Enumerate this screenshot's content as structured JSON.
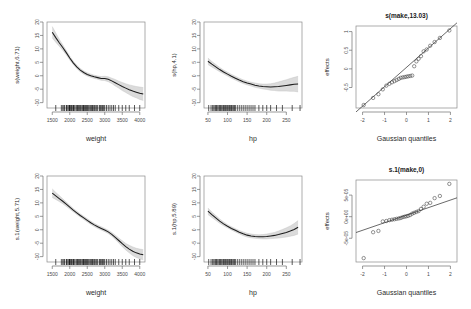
{
  "figure": {
    "layout": "2 rows x 3 columns",
    "background": "#ffffff",
    "line_color": "#1c1c1c",
    "band_color": "#d9d9d9",
    "point_color": "#3a3a3a"
  },
  "chart_data": [
    {
      "id": "panel-weight-top",
      "type": "line",
      "title": "",
      "xlabel": "weight",
      "ylabel": "s(weight,6.71)",
      "xlim": [
        1350,
        4150
      ],
      "ylim": [
        -12,
        20
      ],
      "xticks": [
        1500,
        2000,
        2500,
        3000,
        3500,
        4000
      ],
      "yticks": [
        -10,
        -5,
        0,
        5,
        10,
        15,
        20
      ],
      "grid": false,
      "legend": "none",
      "series": [
        {
          "name": "smooth fit",
          "x": [
            1500,
            1600,
            1700,
            1800,
            1900,
            2000,
            2100,
            2200,
            2300,
            2400,
            2500,
            2600,
            2700,
            2800,
            2900,
            3000,
            3100,
            3200,
            3300,
            3400,
            3500,
            3600,
            3700,
            3800,
            3900,
            4000,
            4100
          ],
          "values": [
            16.2,
            14.2,
            12.3,
            10.5,
            8.6,
            6.6,
            4.8,
            3.3,
            2.1,
            1.2,
            0.5,
            0.0,
            -0.4,
            -0.7,
            -1.0,
            -1.0,
            -1.3,
            -1.9,
            -2.6,
            -3.3,
            -4.0,
            -4.6,
            -5.2,
            -5.7,
            -6.1,
            -6.5,
            -6.8
          ],
          "upper": [
            18.3,
            15.9,
            13.6,
            11.5,
            9.4,
            7.3,
            5.4,
            3.9,
            2.7,
            1.8,
            1.1,
            0.6,
            0.2,
            -0.1,
            -0.3,
            -0.2,
            -0.4,
            -0.9,
            -1.4,
            -2.0,
            -2.5,
            -3.0,
            -3.4,
            -3.7,
            -4.0,
            -4.2,
            -4.4
          ],
          "lower": [
            14.1,
            12.5,
            11.0,
            9.5,
            7.8,
            5.9,
            4.2,
            2.7,
            1.5,
            0.6,
            -0.1,
            -0.6,
            -1.0,
            -1.3,
            -1.7,
            -1.8,
            -2.2,
            -2.9,
            -3.8,
            -4.6,
            -5.5,
            -6.2,
            -7.0,
            -7.7,
            -8.2,
            -8.8,
            -9.2
          ]
        }
      ],
      "rug_x": [
        1600,
        1760,
        1800,
        1835,
        1845,
        1900,
        1915,
        1925,
        1975,
        1985,
        1990,
        2000,
        2025,
        2050,
        2070,
        2100,
        2110,
        2125,
        2155,
        2200,
        2210,
        2230,
        2245,
        2275,
        2300,
        2320,
        2350,
        2375,
        2390,
        2400,
        2425,
        2450,
        2480,
        2500,
        2520,
        2545,
        2575,
        2600,
        2625,
        2650,
        2670,
        2700,
        2720,
        2750,
        2775,
        2800,
        2850,
        2875,
        2900,
        2930,
        2950,
        2975,
        3000,
        3050,
        3100,
        3150,
        3200,
        3250,
        3300,
        3400,
        3500,
        3600,
        3700,
        3850,
        4000
      ]
    },
    {
      "id": "panel-hp-top",
      "type": "line",
      "title": "",
      "xlabel": "hp",
      "ylabel": "s(hp,4.1)",
      "xlim": [
        40,
        290
      ],
      "ylim": [
        -12,
        20
      ],
      "xticks": [
        50,
        100,
        150,
        200,
        250
      ],
      "yticks": [
        -10,
        -5,
        0,
        5,
        10,
        15,
        20
      ],
      "grid": false,
      "legend": "none",
      "series": [
        {
          "name": "smooth fit",
          "x": [
            50,
            60,
            70,
            80,
            90,
            100,
            110,
            120,
            130,
            140,
            150,
            160,
            170,
            180,
            190,
            200,
            210,
            220,
            230,
            240,
            250,
            260,
            270,
            280
          ],
          "values": [
            5.4,
            4.3,
            3.3,
            2.3,
            1.4,
            0.6,
            -0.2,
            -0.9,
            -1.6,
            -2.2,
            -2.7,
            -3.1,
            -3.5,
            -3.8,
            -4.0,
            -4.1,
            -4.2,
            -4.1,
            -4.0,
            -3.8,
            -3.6,
            -3.4,
            -3.2,
            -3.1
          ],
          "upper": [
            6.6,
            5.3,
            4.2,
            3.1,
            2.1,
            1.3,
            0.5,
            -0.2,
            -0.9,
            -1.5,
            -2.0,
            -2.4,
            -2.7,
            -3.0,
            -3.1,
            -3.1,
            -3.0,
            -2.7,
            -2.3,
            -1.9,
            -1.5,
            -1.0,
            -0.6,
            -0.2
          ],
          "lower": [
            4.2,
            3.3,
            2.4,
            1.5,
            0.7,
            -0.1,
            -0.9,
            -1.6,
            -2.3,
            -2.9,
            -3.4,
            -3.8,
            -4.3,
            -4.6,
            -4.9,
            -5.1,
            -5.4,
            -5.5,
            -5.7,
            -5.7,
            -5.7,
            -5.8,
            -5.8,
            -6.0
          ]
        }
      ],
      "rug_x": [
        52,
        58,
        62,
        65,
        68,
        70,
        72,
        75,
        78,
        80,
        82,
        85,
        88,
        90,
        92,
        95,
        97,
        100,
        103,
        105,
        108,
        110,
        112,
        115,
        118,
        120,
        125,
        130,
        135,
        140,
        145,
        150,
        155,
        160,
        165,
        170,
        180,
        190,
        200,
        210,
        225,
        240,
        265,
        285
      ]
    },
    {
      "id": "panel-qq-make-top",
      "type": "scatter",
      "title": "s(make,13.03)",
      "xlabel": "Gaussian quantiles",
      "ylabel": "effects",
      "xlim": [
        -2.3,
        2.3
      ],
      "ylim": [
        -1.05,
        1.15
      ],
      "xticks": [
        -2,
        -1,
        0,
        1,
        2
      ],
      "yticks": [
        -0.5,
        0.0,
        0.5,
        1.0
      ],
      "grid": false,
      "legend": "none",
      "reference_line": {
        "intercept": 0.04,
        "slope": 0.52
      },
      "points_x": [
        -1.95,
        -1.52,
        -1.28,
        -1.08,
        -0.92,
        -0.78,
        -0.66,
        -0.55,
        -0.45,
        -0.35,
        -0.26,
        -0.17,
        -0.08,
        0.0,
        0.08,
        0.17,
        0.26,
        0.35,
        0.45,
        0.55,
        0.66,
        0.78,
        0.92,
        1.08,
        1.28,
        1.52,
        1.95
      ],
      "points_y": [
        -0.97,
        -0.78,
        -0.68,
        -0.55,
        -0.45,
        -0.4,
        -0.36,
        -0.33,
        -0.3,
        -0.27,
        -0.24,
        -0.23,
        -0.22,
        -0.21,
        -0.2,
        -0.19,
        -0.18,
        0.07,
        0.2,
        0.27,
        0.34,
        0.47,
        0.52,
        0.62,
        0.72,
        0.83,
        1.03
      ]
    },
    {
      "id": "panel-weight-bottom",
      "type": "line",
      "title": "",
      "xlabel": "weight",
      "ylabel": "s.1(weight,5.71)",
      "xlim": [
        1350,
        4150
      ],
      "ylim": [
        -12,
        20
      ],
      "xticks": [
        1500,
        2000,
        2500,
        3000,
        3500,
        4000
      ],
      "yticks": [
        -10,
        -5,
        0,
        5,
        10,
        15,
        20
      ],
      "grid": false,
      "legend": "none",
      "series": [
        {
          "name": "smooth fit",
          "x": [
            1500,
            1600,
            1700,
            1800,
            1900,
            2000,
            2100,
            2200,
            2300,
            2400,
            2500,
            2600,
            2700,
            2800,
            2900,
            3000,
            3100,
            3200,
            3300,
            3400,
            3500,
            3600,
            3700,
            3800,
            3900,
            4000,
            4100
          ],
          "values": [
            13.6,
            12.6,
            11.6,
            10.6,
            9.5,
            8.4,
            7.3,
            6.3,
            5.3,
            4.4,
            3.5,
            2.6,
            1.8,
            1.1,
            0.5,
            -0.1,
            -0.8,
            -1.7,
            -2.8,
            -4.0,
            -5.2,
            -6.3,
            -7.2,
            -8.0,
            -8.6,
            -9.0,
            -9.3
          ],
          "upper": [
            15.2,
            13.9,
            12.7,
            11.5,
            10.3,
            9.1,
            7.9,
            6.9,
            5.9,
            5.0,
            4.1,
            3.2,
            2.4,
            1.7,
            1.1,
            0.5,
            -0.2,
            -1.0,
            -2.0,
            -3.1,
            -4.1,
            -5.1,
            -5.8,
            -6.4,
            -6.9,
            -7.2,
            -7.4
          ],
          "lower": [
            12.0,
            11.3,
            10.5,
            9.7,
            8.7,
            7.7,
            6.7,
            5.7,
            4.7,
            3.8,
            2.9,
            2.0,
            1.2,
            0.5,
            -0.1,
            -0.7,
            -1.4,
            -2.4,
            -3.6,
            -4.9,
            -6.3,
            -7.5,
            -8.6,
            -9.6,
            -10.3,
            -10.8,
            -11.2
          ]
        }
      ],
      "rug_x": [
        1600,
        1760,
        1800,
        1835,
        1845,
        1900,
        1915,
        1925,
        1975,
        1985,
        1990,
        2000,
        2025,
        2050,
        2070,
        2100,
        2110,
        2125,
        2155,
        2200,
        2210,
        2230,
        2245,
        2275,
        2300,
        2320,
        2350,
        2375,
        2390,
        2400,
        2425,
        2450,
        2480,
        2500,
        2520,
        2545,
        2575,
        2600,
        2625,
        2650,
        2670,
        2700,
        2720,
        2750,
        2775,
        2800,
        2850,
        2875,
        2900,
        2930,
        2950,
        2975,
        3000,
        3050,
        3100,
        3150,
        3200,
        3250,
        3300,
        3400,
        3500,
        3600,
        3700,
        3850,
        4000
      ]
    },
    {
      "id": "panel-hp-bottom",
      "type": "line",
      "title": "",
      "xlabel": "hp",
      "ylabel": "s.1(hp,5.89)",
      "xlim": [
        40,
        290
      ],
      "ylim": [
        -12,
        20
      ],
      "xticks": [
        50,
        100,
        150,
        200,
        250
      ],
      "yticks": [
        -10,
        -5,
        0,
        5,
        10,
        15,
        20
      ],
      "grid": false,
      "legend": "none",
      "series": [
        {
          "name": "smooth fit",
          "x": [
            50,
            60,
            70,
            80,
            90,
            100,
            110,
            120,
            130,
            140,
            150,
            160,
            170,
            180,
            190,
            200,
            210,
            220,
            230,
            240,
            250,
            260,
            270,
            280
          ],
          "values": [
            6.9,
            5.6,
            4.4,
            3.2,
            2.2,
            1.3,
            0.5,
            -0.2,
            -0.9,
            -1.5,
            -2.0,
            -2.3,
            -2.5,
            -2.6,
            -2.6,
            -2.5,
            -2.3,
            -2.1,
            -1.8,
            -1.4,
            -1.0,
            -0.5,
            0.1,
            0.9
          ],
          "upper": [
            8.1,
            6.6,
            5.3,
            4.0,
            2.9,
            1.9,
            1.1,
            0.4,
            -0.3,
            -0.8,
            -1.3,
            -1.6,
            -1.8,
            -1.9,
            -1.8,
            -1.6,
            -1.3,
            -1.0,
            -0.5,
            0.1,
            0.7,
            1.4,
            2.3,
            3.4
          ],
          "lower": [
            5.7,
            4.6,
            3.5,
            2.4,
            1.5,
            0.7,
            -0.1,
            -0.8,
            -1.5,
            -2.2,
            -2.7,
            -3.0,
            -3.2,
            -3.3,
            -3.4,
            -3.4,
            -3.3,
            -3.2,
            -3.1,
            -2.9,
            -2.7,
            -2.4,
            -2.1,
            -1.6
          ]
        }
      ],
      "rug_x": [
        52,
        58,
        62,
        65,
        68,
        70,
        72,
        75,
        78,
        80,
        82,
        85,
        88,
        90,
        92,
        95,
        97,
        100,
        103,
        105,
        108,
        110,
        112,
        115,
        118,
        120,
        125,
        130,
        135,
        140,
        145,
        150,
        155,
        160,
        165,
        170,
        180,
        190,
        200,
        210,
        225,
        240,
        265,
        285
      ]
    },
    {
      "id": "panel-qq-make-bottom",
      "type": "scatter",
      "title": "s.1(make,0)",
      "xlabel": "Gaussian quantiles",
      "ylabel": "effects",
      "xlim": [
        -2.3,
        2.3
      ],
      "ylim": [
        -0.000105,
        8.5e-05
      ],
      "xticks": [
        -2,
        -1,
        0,
        1,
        2
      ],
      "yticks": [
        -5e-05,
        0.0,
        5e-05
      ],
      "ytick_labels": [
        "-5e-05",
        "0e+00",
        "5e-05"
      ],
      "grid": false,
      "legend": "none",
      "reference_line": {
        "intercept": 3.5e-06,
        "slope": 1.75e-05
      },
      "points_x": [
        -1.95,
        -1.52,
        -1.28,
        -1.08,
        -0.92,
        -0.78,
        -0.66,
        -0.55,
        -0.45,
        -0.35,
        -0.26,
        -0.17,
        -0.08,
        0.0,
        0.08,
        0.17,
        0.26,
        0.35,
        0.45,
        0.55,
        0.66,
        0.78,
        0.92,
        1.08,
        1.28,
        1.52,
        1.95
      ],
      "points_y": [
        -9.6e-05,
        -3.6e-05,
        -3.3e-05,
        -1.1e-05,
        -1e-05,
        -8e-06,
        -7e-06,
        -6e-06,
        -5e-06,
        -4e-06,
        -3e-06,
        -1e-06,
        0.0,
        1e-06,
        2e-06,
        4e-06,
        7e-06,
        9e-06,
        1.1e-05,
        1.3e-05,
        1.8e-05,
        2.3e-05,
        3e-05,
        3.2e-05,
        4.3e-05,
        4.8e-05,
        7.6e-05
      ]
    }
  ]
}
